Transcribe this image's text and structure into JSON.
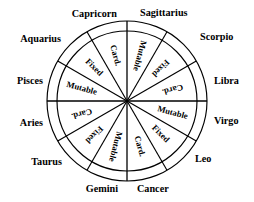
{
  "figure": {
    "geometry": {
      "center_x": 127,
      "center_y": 101,
      "outer_radius": 80,
      "inner_ring_radius": 70,
      "sector_count": 12,
      "sector_degrees": 30,
      "modality_label_radius": 47,
      "sign_label_radius": 92
    },
    "colors": {
      "stroke": "#000000",
      "background": "#ffffff",
      "text": "#000000"
    }
  },
  "sectors": [
    {
      "sign": "Sagittarius",
      "modality": "Mutable",
      "mid_angle": -75,
      "sign_anchor": "start",
      "sign_x": 140,
      "sign_y": 14
    },
    {
      "sign": "Scorpio",
      "modality": "Fixed",
      "mid_angle": -45,
      "sign_anchor": "start",
      "sign_x": 200,
      "sign_y": 38
    },
    {
      "sign": "Libra",
      "modality": "Card.",
      "mid_angle": -15,
      "sign_anchor": "start",
      "sign_x": 214,
      "sign_y": 82
    },
    {
      "sign": "Virgo",
      "modality": "Mutable",
      "mid_angle": 15,
      "sign_anchor": "start",
      "sign_x": 214,
      "sign_y": 122
    },
    {
      "sign": "Leo",
      "modality": "Fixed",
      "mid_angle": 45,
      "sign_anchor": "start",
      "sign_x": 195,
      "sign_y": 160
    },
    {
      "sign": "Cancer",
      "modality": "Card.",
      "mid_angle": 75,
      "sign_anchor": "start",
      "sign_x": 137,
      "sign_y": 190
    },
    {
      "sign": "Gemini",
      "modality": "Mutable",
      "mid_angle": 105,
      "sign_anchor": "end",
      "sign_x": 118,
      "sign_y": 190
    },
    {
      "sign": "Taurus",
      "modality": "Fixed",
      "mid_angle": 135,
      "sign_anchor": "end",
      "sign_x": 62,
      "sign_y": 163
    },
    {
      "sign": "Aries",
      "modality": "Card.",
      "mid_angle": 165,
      "sign_anchor": "end",
      "sign_x": 43,
      "sign_y": 124
    },
    {
      "sign": "Pisces",
      "modality": "Mutable",
      "mid_angle": -165,
      "sign_anchor": "end",
      "sign_x": 43,
      "sign_y": 82
    },
    {
      "sign": "Aquarius",
      "modality": "Fixed",
      "mid_angle": -135,
      "sign_anchor": "end",
      "sign_x": 61,
      "sign_y": 40
    },
    {
      "sign": "Capricorn",
      "modality": "Card.",
      "mid_angle": -105,
      "sign_anchor": "end",
      "sign_x": 117,
      "sign_y": 15
    }
  ],
  "legend": {
    "modalities": [
      "Card.",
      "Fixed",
      "Mutable"
    ],
    "signs": [
      "Aries",
      "Taurus",
      "Gemini",
      "Cancer",
      "Leo",
      "Virgo",
      "Libra",
      "Scorpio",
      "Sagittarius",
      "Capricorn",
      "Aquarius",
      "Pisces"
    ]
  }
}
